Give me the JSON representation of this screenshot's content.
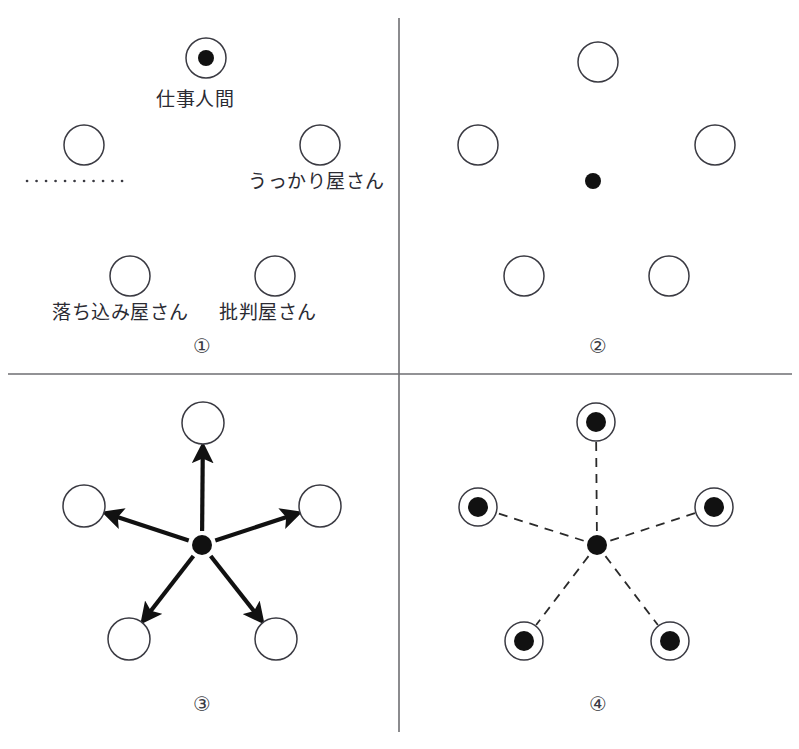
{
  "figure": {
    "title": "",
    "width": 799,
    "height": 749,
    "background_color": "#ffffff",
    "divider_color": "#6e6e72",
    "ink_color": "#111111",
    "ring_color": "#3a3a42"
  },
  "panels": [
    {
      "number_label": "①",
      "number_x": 193,
      "number_y": 336,
      "description": "labelled inner-parts diagram",
      "center": {
        "x": 199,
        "y": 187
      },
      "center_marker": "none",
      "nodes": [
        {
          "name": "top",
          "cx": 206,
          "cy": 58,
          "r": 20,
          "filled": true,
          "dot_r": 8
        },
        {
          "name": "upper-left",
          "cx": 84,
          "cy": 145,
          "r": 20,
          "filled": false,
          "dot_r": 0
        },
        {
          "name": "upper-right",
          "cx": 320,
          "cy": 145,
          "r": 20,
          "filled": false,
          "dot_r": 0
        },
        {
          "name": "lower-left",
          "cx": 130,
          "cy": 276,
          "r": 20,
          "filled": false,
          "dot_r": 0
        },
        {
          "name": "lower-right",
          "cx": 275,
          "cy": 276,
          "r": 20,
          "filled": false,
          "dot_r": 0
        }
      ],
      "labels": [
        {
          "text": "仕事人間",
          "x": 156,
          "y": 90
        },
        {
          "text": "うっかり屋さん",
          "x": 248,
          "y": 172
        },
        {
          "text": "落ち込み屋さん",
          "x": 52,
          "y": 303
        },
        {
          "text": "批判屋さん",
          "x": 219,
          "y": 303
        }
      ],
      "dotted_rule": {
        "x1": 27,
        "y1": 181,
        "x2": 127,
        "y2": 181
      }
    },
    {
      "number_label": "②",
      "number_x": 589,
      "number_y": 336,
      "description": "unlabelled parts with isolated centre self",
      "center": {
        "x": 593,
        "y": 181
      },
      "center_marker": "dot",
      "center_dot_r": 8,
      "nodes": [
        {
          "name": "top",
          "cx": 598,
          "cy": 62,
          "r": 20,
          "filled": false,
          "dot_r": 0
        },
        {
          "name": "upper-left",
          "cx": 478,
          "cy": 145,
          "r": 20,
          "filled": false,
          "dot_r": 0
        },
        {
          "name": "upper-right",
          "cx": 715,
          "cy": 145,
          "r": 20,
          "filled": false,
          "dot_r": 0
        },
        {
          "name": "lower-left",
          "cx": 524,
          "cy": 276,
          "r": 20,
          "filled": false,
          "dot_r": 0
        },
        {
          "name": "lower-right",
          "cx": 669,
          "cy": 276,
          "r": 20,
          "filled": false,
          "dot_r": 0
        }
      ],
      "labels": [],
      "dotted_rule": null
    },
    {
      "number_label": "③",
      "number_x": 193,
      "number_y": 694,
      "description": "centre self with solid arrows pointing out to each part",
      "center": {
        "x": 202,
        "y": 545
      },
      "center_marker": "dot",
      "center_dot_r": 10,
      "nodes": [
        {
          "name": "top",
          "cx": 203,
          "cy": 423,
          "r": 21,
          "filled": false,
          "dot_r": 0
        },
        {
          "name": "upper-left",
          "cx": 84,
          "cy": 506,
          "r": 21,
          "filled": false,
          "dot_r": 0
        },
        {
          "name": "upper-right",
          "cx": 320,
          "cy": 506,
          "r": 21,
          "filled": false,
          "dot_r": 0
        },
        {
          "name": "lower-left",
          "cx": 129,
          "cy": 639,
          "r": 21,
          "filled": false,
          "dot_r": 0
        },
        {
          "name": "lower-right",
          "cx": 276,
          "cy": 639,
          "r": 21,
          "filled": false,
          "dot_r": 0
        }
      ],
      "connector_style": "solid-arrow",
      "labels": [],
      "dotted_rule": null
    },
    {
      "number_label": "④",
      "number_x": 589,
      "number_y": 694,
      "description": "centre self dash-linked to parts that each contain the self",
      "center": {
        "x": 597,
        "y": 545
      },
      "center_marker": "dot",
      "center_dot_r": 10,
      "nodes": [
        {
          "name": "top",
          "cx": 596,
          "cy": 422,
          "r": 19,
          "filled": true,
          "dot_r": 10
        },
        {
          "name": "upper-left",
          "cx": 478,
          "cy": 507,
          "r": 19,
          "filled": true,
          "dot_r": 10
        },
        {
          "name": "upper-right",
          "cx": 714,
          "cy": 507,
          "r": 19,
          "filled": true,
          "dot_r": 10
        },
        {
          "name": "lower-left",
          "cx": 524,
          "cy": 641,
          "r": 19,
          "filled": true,
          "dot_r": 10
        },
        {
          "name": "lower-right",
          "cx": 670,
          "cy": 641,
          "r": 19,
          "filled": true,
          "dot_r": 10
        }
      ],
      "connector_style": "dashed",
      "labels": [],
      "dotted_rule": null
    }
  ],
  "dividers": {
    "vertical": {
      "x": 399,
      "y1": 18,
      "y2": 732
    },
    "horizontal": {
      "y": 374,
      "x1": 8,
      "x2": 792
    }
  }
}
